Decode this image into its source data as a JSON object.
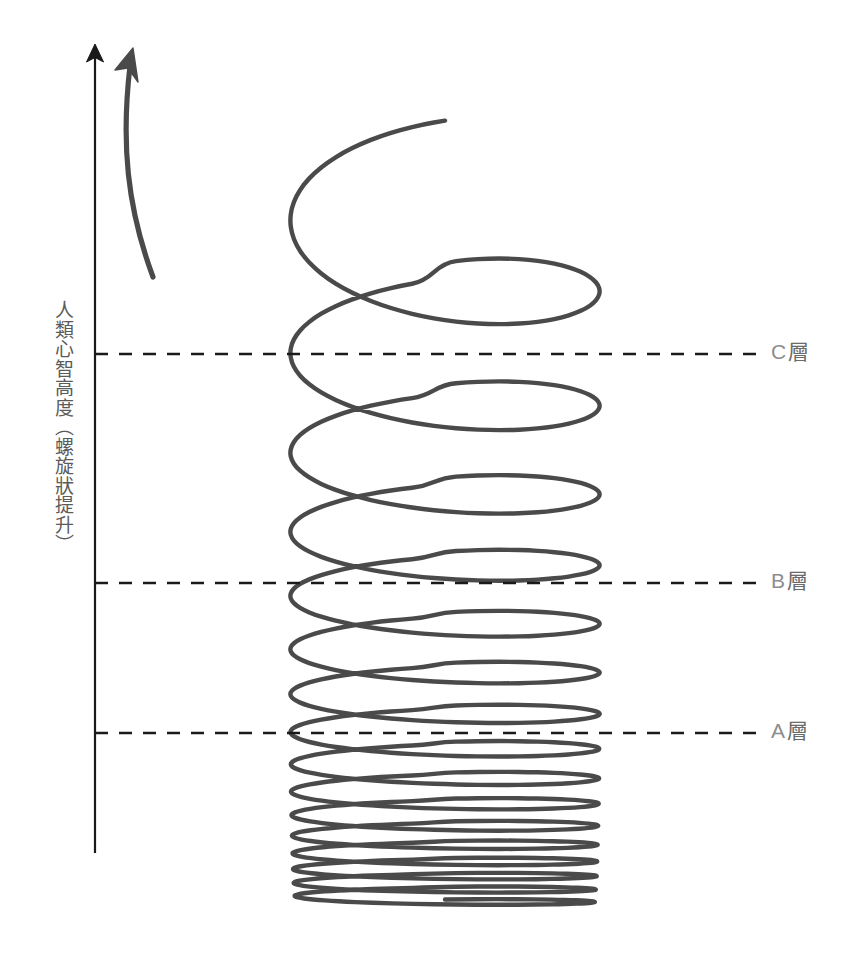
{
  "diagram": {
    "background_color": "#ffffff",
    "stroke_color": "#4a4a4a",
    "axis_color": "#1a1a1a",
    "label_color": "#8d8d8d",
    "axis_title": "人類心智高度（螺旋狀提升）",
    "axis": {
      "x": 95,
      "top_y": 45,
      "bottom_y": 853,
      "arrow_icon": "up-arrow-icon"
    },
    "spiral": {
      "description": "logarithmically expanding helix rising from bottom to top",
      "left_x": 135,
      "right_x": 755,
      "bottom_y": 905,
      "top_y": 185,
      "turn_count": 16,
      "arrow_icon": "curved-up-arrow-icon",
      "arrow_tip": {
        "x": 127,
        "y": 48
      }
    },
    "layers": [
      {
        "id": "c",
        "label_letter": "C",
        "label_suffix": "層",
        "y": 354,
        "line_start_x": 95,
        "line_end_x": 762
      },
      {
        "id": "b",
        "label_letter": "B",
        "label_suffix": "層",
        "y": 583,
        "line_start_x": 95,
        "line_end_x": 762
      },
      {
        "id": "a",
        "label_letter": "A",
        "label_suffix": "層",
        "y": 733,
        "line_start_x": 95,
        "line_end_x": 762
      }
    ]
  },
  "chart_data": {
    "type": "line",
    "title": "",
    "xlabel": "",
    "ylabel": "人類心智高度（螺旋狀提升）",
    "annotations": [
      "C層",
      "B層",
      "A層"
    ],
    "reference_lines": [
      {
        "label": "C層",
        "y_px": 354
      },
      {
        "label": "B層",
        "y_px": 583
      },
      {
        "label": "A層",
        "y_px": 733
      }
    ],
    "series": [
      {
        "name": "spiral-ascent",
        "description": "helix whose vertical pitch increases with height, representing spiral growth of human mind",
        "turns": 16,
        "pitch_px": [
          12,
          13,
          14,
          16,
          18,
          21,
          24,
          28,
          33,
          39,
          46,
          55,
          66,
          82,
          104,
          140
        ],
        "amplitude_px": [
          300,
          302,
          304,
          305,
          306,
          307,
          308,
          309,
          309,
          310,
          310,
          310,
          310,
          310,
          310,
          310
        ]
      }
    ],
    "grid": false,
    "legend": null
  }
}
